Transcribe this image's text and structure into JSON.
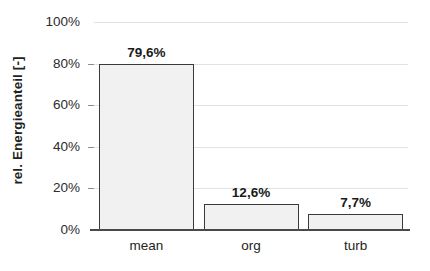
{
  "chart_data": {
    "type": "bar",
    "title": "",
    "subtitle": "",
    "xlabel": "",
    "ylabel": "rel. Energieanteil [-]",
    "categories": [
      "mean",
      "org",
      "turb"
    ],
    "values": [
      79.6,
      12.6,
      7.7
    ],
    "data_labels": [
      "79,6%",
      "12,6%",
      "7,7%"
    ],
    "ylim": [
      0,
      100
    ],
    "ytick_values": [
      100,
      80,
      60,
      40,
      20,
      0
    ],
    "ytick_labels": [
      "100%",
      "80%",
      "60%",
      "40%",
      "20%",
      "0%"
    ],
    "grid": true,
    "grid_axis": "y",
    "legend": false,
    "legend_position": "none",
    "series": [
      {
        "name": "rel. Energieanteil",
        "values": [
          79.6,
          12.6,
          7.7
        ]
      }
    ],
    "colors": {
      "bar_fill": "#f1f1f1",
      "bar_border": "#3a3a3a",
      "gridline": "#e2e2e2",
      "axis": "#4a4a4a",
      "text": "#231f20",
      "background": "#ffffff"
    }
  }
}
